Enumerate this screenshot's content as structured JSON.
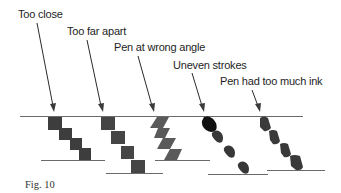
{
  "figure": {
    "caption": "Fig. 10",
    "colors": {
      "ink_dark": "#3d3d3d",
      "ink_medium": "#4a4a4a",
      "ink_angle": "#5a5a5a",
      "ink_heavy": "#111111",
      "ink_blob": "#383838",
      "line": "#6a6a6a"
    },
    "examples": [
      {
        "id": "too-close",
        "label": "Too close"
      },
      {
        "id": "too-far-apart",
        "label": "Too far apart"
      },
      {
        "id": "pen-wrong-angle",
        "label": "Pen at wrong angle"
      },
      {
        "id": "uneven-strokes",
        "label": "Uneven strokes"
      },
      {
        "id": "too-much-ink",
        "label": "Pen had too much ink"
      }
    ]
  }
}
